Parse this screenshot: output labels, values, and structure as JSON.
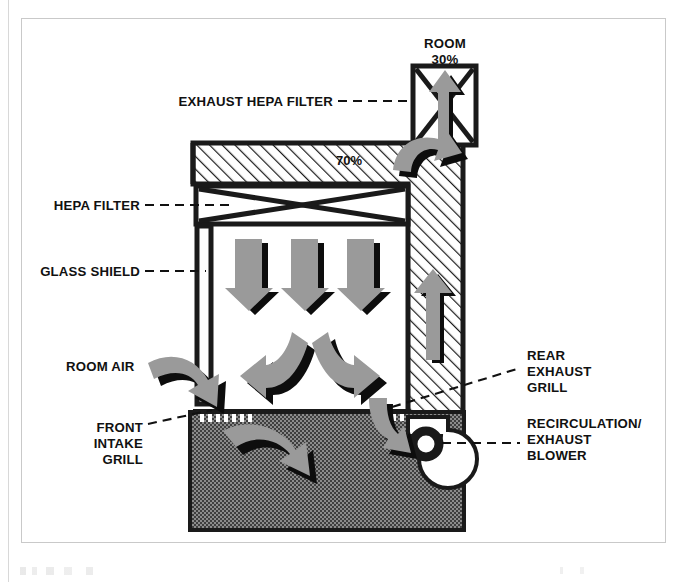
{
  "figure": {
    "type": "cross-section-diagram"
  },
  "labels": {
    "room": "ROOM",
    "room_percent": "30%",
    "exhaust_hepa_filter": "EXHAUST HEPA FILTER",
    "plenum_percent": "70%",
    "hepa_filter": "HEPA FILTER",
    "glass_shield": "GLASS SHIELD",
    "room_air": "ROOM AIR",
    "front_intake_grill_line1": "FRONT",
    "front_intake_grill_line2": "INTAKE",
    "front_intake_grill_line3": "GRILL",
    "rear_exhaust_grill_line1": "REAR",
    "rear_exhaust_grill_line2": "EXHAUST",
    "rear_exhaust_grill_line3": "GRILL",
    "recirculation_blower_line1": "RECIRCULATION/",
    "recirculation_blower_line2": "EXHAUST",
    "recirculation_blower_line3": "BLOWER"
  },
  "components": [
    {
      "id": "exhaust-hepa-filter",
      "label": "EXHAUST HEPA FILTER",
      "kind": "filter-box-x-pattern"
    },
    {
      "id": "supply-hepa-filter",
      "label": "HEPA FILTER",
      "kind": "filter-band-x-pattern"
    },
    {
      "id": "glass-shield",
      "label": "GLASS SHIELD",
      "kind": "vertical-panel"
    },
    {
      "id": "front-intake-grill",
      "label": "FRONT INTAKE GRILL",
      "kind": "comb-grill"
    },
    {
      "id": "rear-exhaust-grill",
      "label": "REAR EXHAUST GRILL",
      "kind": "slot-grill"
    },
    {
      "id": "recirculation-exhaust-blower",
      "label": "RECIRCULATION/EXHAUST BLOWER",
      "kind": "scroll-blower"
    },
    {
      "id": "rear-plenum",
      "label": "70%",
      "kind": "hatched-plenum"
    },
    {
      "id": "lower-plenum",
      "label": "",
      "kind": "stippled-plenum"
    }
  ],
  "airflow": {
    "exhaust_fraction_label": "30%",
    "recirculation_fraction_label": "70%",
    "arrows": [
      {
        "name": "exhaust-up-arrow",
        "direction": "up",
        "zone": "exhaust-hepa"
      },
      {
        "name": "plenum-turn-arrow",
        "direction": "curve-up-right",
        "zone": "top-plenum"
      },
      {
        "name": "downflow-arrow-1",
        "direction": "down",
        "zone": "work-zone"
      },
      {
        "name": "downflow-arrow-2",
        "direction": "down",
        "zone": "work-zone"
      },
      {
        "name": "downflow-arrow-3",
        "direction": "down",
        "zone": "work-zone"
      },
      {
        "name": "split-arrow-left",
        "direction": "curve-down-left",
        "zone": "work-zone"
      },
      {
        "name": "split-arrow-right",
        "direction": "curve-down-right",
        "zone": "work-zone"
      },
      {
        "name": "room-air-inflow-arrow",
        "direction": "curve-down-right",
        "zone": "front-intake"
      },
      {
        "name": "rear-exhaust-down-arrow",
        "direction": "curve-down",
        "zone": "rear-exhaust-grill"
      },
      {
        "name": "lower-plenum-arrow",
        "direction": "curve-right",
        "zone": "lower-plenum"
      },
      {
        "name": "rear-duct-up-arrow",
        "direction": "up",
        "zone": "rear-plenum"
      }
    ]
  },
  "colors": {
    "arrow_fill": "#9a9a9a",
    "arrow_shadow": "#0d0d0d",
    "structure_stroke": "#1a1a1a",
    "hatch_stroke": "#1a1a1a",
    "stipple_dark": "#4a4a4a",
    "background": "#ffffff",
    "frame": "#c9c9c9"
  }
}
